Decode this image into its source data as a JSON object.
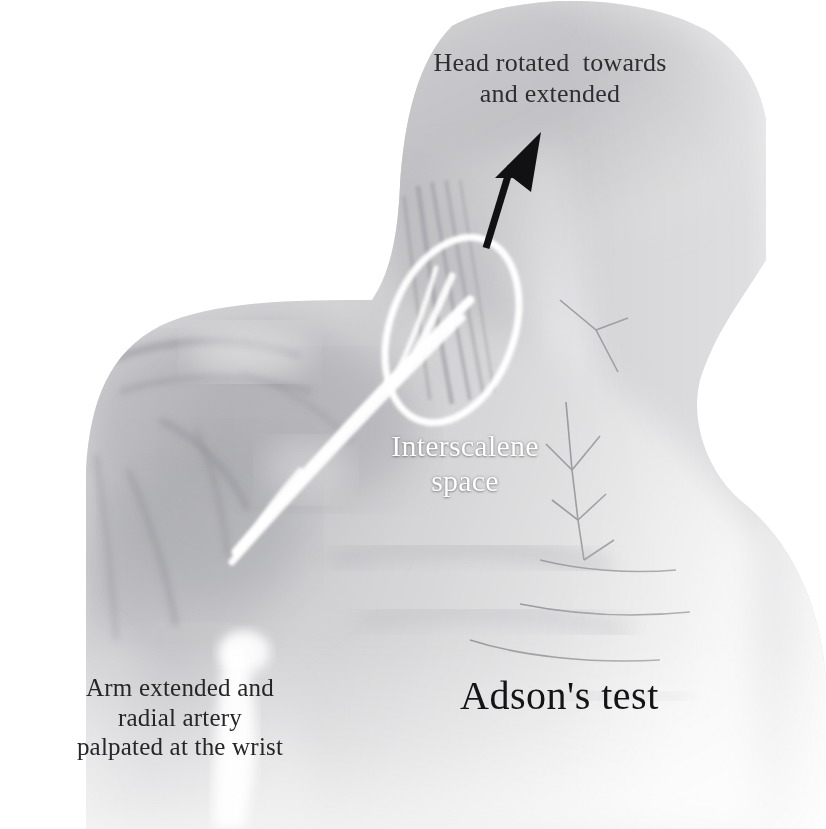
{
  "figure": {
    "kind": "anatomical-illustration",
    "medium": "grayscale pencil drawing",
    "background_color": "#ffffff",
    "ink_color": "#2e2e30",
    "highlight_color": "#ffffff",
    "arrow_color": "#111113"
  },
  "labels": {
    "head": "Head rotated  towards\nand extended",
    "interscalene": "Interscalene\nspace",
    "arm": "Arm extended and\nradial artery\npalpated at the wrist",
    "title": "Adson's test"
  },
  "annotations": {
    "arrow": {
      "name": "direction-of-head-rotation",
      "from": [
        486,
        248
      ],
      "to": [
        516,
        148
      ],
      "color": "#111113"
    },
    "ellipse": {
      "name": "interscalene-space-outline",
      "center": [
        452,
        330
      ],
      "radius_x": 62,
      "radius_y": 96,
      "rotation_deg": 20,
      "color": "#ffffff"
    },
    "plexus_lines": {
      "name": "brachial-plexus-and-subclavian-artery",
      "color": "#ffffff",
      "from": [
        462,
        322
      ],
      "to": [
        232,
        556
      ]
    }
  },
  "caption_strip": {
    "text": "",
    "note": "bottom caption line is cropped by the page edge and illegible"
  }
}
